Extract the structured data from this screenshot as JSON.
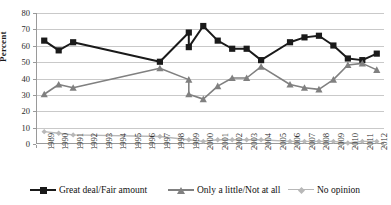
{
  "chart_data": {
    "type": "line",
    "title": "",
    "xlabel": "",
    "ylabel": "Percent",
    "ylim": [
      0,
      80
    ],
    "ytick_values": [
      0,
      10,
      20,
      30,
      40,
      50,
      60,
      70,
      80
    ],
    "ytick_labels": [
      "0",
      "10",
      "20",
      "30",
      "40",
      "50",
      "60",
      "70",
      "80"
    ],
    "grid": true,
    "legend_position": "bottom",
    "categories": [
      "1989",
      "1990",
      "1991",
      "1992",
      "1993",
      "1994",
      "1995",
      "1996",
      "1997",
      "1998",
      "1999",
      "2000",
      "2001",
      "2002",
      "2003",
      "2004",
      "2005",
      "2006",
      "2007",
      "2008",
      "2009",
      "2010",
      "2011",
      "2012"
    ],
    "note_duplicate_1999": "1999 has two readings plotted at the same x position for the first two series",
    "series": [
      {
        "name": "Great deal/Fair amount",
        "color": "#1a1a1a",
        "marker": "square",
        "points": [
          {
            "x": "1989",
            "y": 63
          },
          {
            "x": "1990",
            "y": 57
          },
          {
            "x": "1991",
            "y": 62
          },
          {
            "x": "1997",
            "y": 50
          },
          {
            "x": "1999",
            "y": 68
          },
          {
            "x": "1999",
            "y": 59
          },
          {
            "x": "2000",
            "y": 72
          },
          {
            "x": "2001",
            "y": 63
          },
          {
            "x": "2002",
            "y": 58
          },
          {
            "x": "2003",
            "y": 58
          },
          {
            "x": "2004",
            "y": 51
          },
          {
            "x": "2006",
            "y": 62
          },
          {
            "x": "2007",
            "y": 65
          },
          {
            "x": "2008",
            "y": 66
          },
          {
            "x": "2009",
            "y": 60
          },
          {
            "x": "2010",
            "y": 52
          },
          {
            "x": "2011",
            "y": 51
          },
          {
            "x": "2012",
            "y": 55
          }
        ]
      },
      {
        "name": "Only a little/Not at all",
        "color": "#808080",
        "marker": "triangle",
        "points": [
          {
            "x": "1989",
            "y": 30
          },
          {
            "x": "1990",
            "y": 36
          },
          {
            "x": "1991",
            "y": 34
          },
          {
            "x": "1997",
            "y": 46
          },
          {
            "x": "1999",
            "y": 39
          },
          {
            "x": "1999",
            "y": 30
          },
          {
            "x": "2000",
            "y": 27
          },
          {
            "x": "2001",
            "y": 35
          },
          {
            "x": "2002",
            "y": 40
          },
          {
            "x": "2003",
            "y": 40
          },
          {
            "x": "2004",
            "y": 47
          },
          {
            "x": "2006",
            "y": 36
          },
          {
            "x": "2007",
            "y": 34
          },
          {
            "x": "2008",
            "y": 33
          },
          {
            "x": "2009",
            "y": 39
          },
          {
            "x": "2010",
            "y": 48
          },
          {
            "x": "2011",
            "y": 49
          },
          {
            "x": "2012",
            "y": 45
          }
        ]
      },
      {
        "name": "No opinion",
        "color": "#b8b8b8",
        "marker": "diamond",
        "points": [
          {
            "x": "1989",
            "y": 7
          },
          {
            "x": "1990",
            "y": 6
          },
          {
            "x": "1991",
            "y": 5
          },
          {
            "x": "1997",
            "y": 4
          },
          {
            "x": "1999",
            "y": 2
          },
          {
            "x": "2000",
            "y": 1
          },
          {
            "x": "2001",
            "y": 2
          },
          {
            "x": "2002",
            "y": 2
          },
          {
            "x": "2003",
            "y": 2
          },
          {
            "x": "2004",
            "y": 2
          },
          {
            "x": "2006",
            "y": 1
          },
          {
            "x": "2007",
            "y": 1
          },
          {
            "x": "2008",
            "y": 1
          },
          {
            "x": "2009",
            "y": 1
          },
          {
            "x": "2010",
            "y": 0
          },
          {
            "x": "2011",
            "y": 1
          },
          {
            "x": "2012",
            "y": 1
          }
        ]
      }
    ]
  },
  "legend": {
    "items": [
      {
        "label": "Great deal/Fair amount"
      },
      {
        "label": "Only a little/Not at all"
      },
      {
        "label": "No opinion"
      }
    ]
  }
}
